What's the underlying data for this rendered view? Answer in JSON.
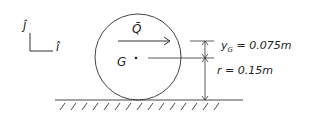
{
  "diagram": {
    "axes": {
      "vertical_label": "ĵ",
      "horizontal_label": "î"
    },
    "body": {
      "shape": "circle",
      "center_label": "G"
    },
    "force": {
      "label": "Q̄",
      "direction": "right"
    },
    "dimensions": {
      "yG": {
        "label": "y",
        "sub": "G",
        "value": " = 0.075m"
      },
      "r": {
        "label": "r = 0.15m"
      }
    },
    "ground": {
      "type": "hatched-surface"
    },
    "colors": {
      "ink": "#333333",
      "background": "#ffffff"
    }
  }
}
